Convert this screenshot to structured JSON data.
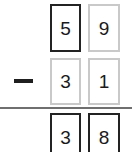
{
  "problem": {
    "type": "vertical-subtraction",
    "operator_symbol": "−",
    "operator_name": "minus-sign",
    "minuend": "59",
    "subtrahend": "31",
    "difference": "38",
    "rows": [
      {
        "role": "minuend",
        "cells": [
          {
            "value": "5",
            "style": "dark",
            "place": "tens"
          },
          {
            "value": "9",
            "style": "light",
            "place": "ones"
          }
        ]
      },
      {
        "role": "subtrahend",
        "cells": [
          {
            "value": "3",
            "style": "light",
            "place": "tens"
          },
          {
            "value": "1",
            "style": "light",
            "place": "ones"
          }
        ]
      },
      {
        "role": "difference",
        "cells": [
          {
            "value": "3",
            "style": "dark",
            "place": "tens"
          },
          {
            "value": "8",
            "style": "dark",
            "place": "ones"
          }
        ]
      }
    ]
  },
  "colors": {
    "background": "#ffffff",
    "digit": "#1a1a1a",
    "border_dark": "#232323",
    "border_light": "#c9c9c9",
    "rule": "#6f6f6f",
    "operator": "#1f1f1f"
  }
}
